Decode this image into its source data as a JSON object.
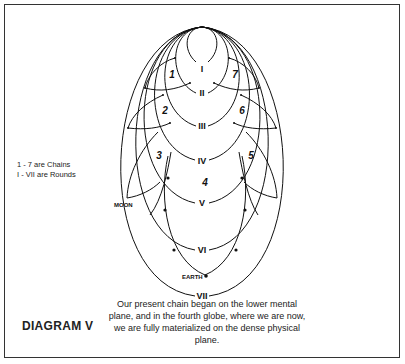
{
  "diagram": {
    "title": "DIAGRAM V",
    "legend": {
      "line1": "1 - 7 are Chains",
      "line2": "I - VII are Rounds"
    },
    "caption": "Our present chain began on the lower mental plane, and in the fourth globe, where we are now, we are fully materialized on the dense physical plane.",
    "rounds": [
      "I",
      "II",
      "III",
      "IV",
      "V",
      "VI",
      "VII"
    ],
    "chains": [
      "1",
      "2",
      "3",
      "4",
      "5",
      "6",
      "7"
    ],
    "markers": {
      "moon": "MOON",
      "earth": "EARTH"
    }
  }
}
